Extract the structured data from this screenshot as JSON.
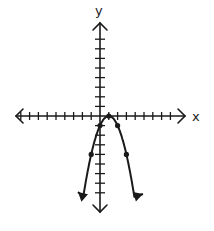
{
  "chart_data": {
    "type": "line",
    "title": "",
    "xlabel": "x",
    "ylabel": "y",
    "xlim": [
      -10,
      9
    ],
    "ylim": [
      -9,
      9
    ],
    "grid": false,
    "equation": "y = -(x - 1)^2",
    "vertex": [
      1,
      0
    ],
    "series": [
      {
        "name": "parabola",
        "points": [
          [
            -2.4,
            -11.6
          ],
          [
            -1,
            -4
          ],
          [
            0,
            -1
          ],
          [
            1,
            0
          ],
          [
            2,
            -1
          ],
          [
            3,
            -4
          ],
          [
            4.3,
            -10.9
          ]
        ],
        "marked_points": [
          [
            -1,
            -4
          ],
          [
            0,
            -1
          ],
          [
            1,
            0
          ],
          [
            2,
            -1
          ],
          [
            3,
            -4
          ]
        ],
        "color": "#1a1a1a"
      }
    ]
  },
  "axes": {
    "x_label": "x",
    "y_label": "y"
  }
}
